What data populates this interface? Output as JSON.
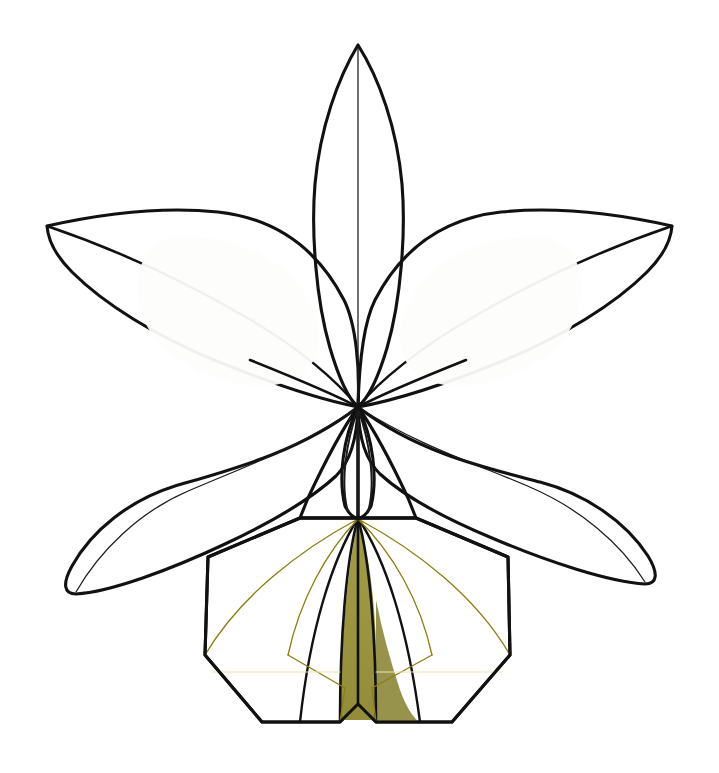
{
  "document": {
    "kind": "botanical-line-diagram",
    "subject": "orchid flower (Cattleya-type), face-on view",
    "background_color": "#ffffff",
    "canvas": {
      "width": 719,
      "height": 773
    }
  },
  "palette": {
    "outline_black": "#111111",
    "thin_vein": "#1b1b1b",
    "petal_white": "#fbfbfa",
    "petal_shade": "#f4f4f1",
    "petal_highlight": "#fdfdfc",
    "lip_yellow": "#f5db14",
    "lip_yellow_light": "#f7e23a",
    "lip_olive": "#9a9442",
    "lip_olive_dark": "#8d8738",
    "vein_yellow": "#8d7c10",
    "vein_pale": "#e9e4b0"
  },
  "parts": [
    {
      "id": "dorsal-sepal",
      "label": "Dorsal sepal",
      "position": "top-center",
      "fill": "#fbfbfa",
      "outline": "#111111",
      "has_midvein": true,
      "tip": [
        358,
        45
      ],
      "base": [
        358,
        407
      ]
    },
    {
      "id": "petal-left",
      "label": "Left petal",
      "position": "upper-left",
      "fill": "#fbfbfa",
      "outline": "#111111",
      "has_midvein": true,
      "tip": [
        47,
        226
      ],
      "base": [
        358,
        407
      ]
    },
    {
      "id": "petal-right",
      "label": "Right petal",
      "position": "upper-right",
      "fill": "#fbfbfa",
      "outline": "#111111",
      "has_midvein": true,
      "tip": [
        672,
        226
      ],
      "base": [
        358,
        407
      ]
    },
    {
      "id": "lateral-sepal-left",
      "label": "Left lateral sepal",
      "position": "lower-left",
      "fill": "#fbfbfa",
      "outline": "#111111",
      "has_midvein": true,
      "tip": [
        68,
        592
      ],
      "base": [
        358,
        407
      ]
    },
    {
      "id": "lateral-sepal-right",
      "label": "Right lateral sepal",
      "position": "lower-right",
      "fill": "#fbfbfa",
      "outline": "#111111",
      "has_midvein": true,
      "tip": [
        660,
        580
      ],
      "base": [
        358,
        407
      ]
    },
    {
      "id": "column",
      "label": "Column",
      "position": "center",
      "fill": "#fbfbfa",
      "outline": "#111111",
      "top": [
        358,
        407
      ],
      "bottom": [
        358,
        518
      ]
    },
    {
      "id": "labellum",
      "label": "Labellum (lip)",
      "position": "bottom-center",
      "fill": "#f5db14",
      "outline": "#111111",
      "throat_fill": "#9a9442",
      "radiating_veins": 6,
      "top_attachment": [
        358,
        518
      ]
    }
  ],
  "geometry": {
    "center_hub": [
      358,
      407
    ],
    "lip_apex": [
      358,
      518
    ],
    "overall_bounds": {
      "x": 44,
      "y": 42,
      "width": 630,
      "height": 695
    }
  }
}
